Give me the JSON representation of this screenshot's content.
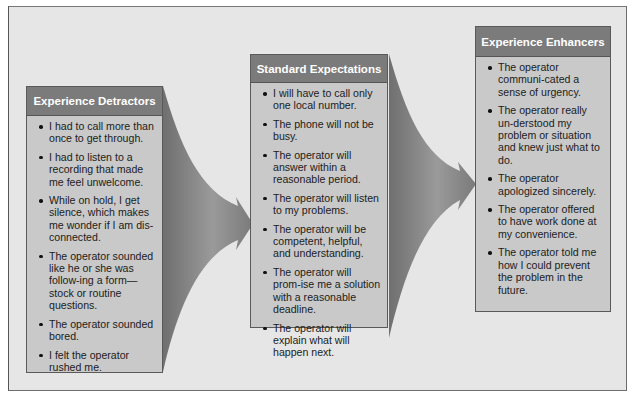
{
  "diagram": {
    "panels": [
      {
        "title": "Experience Detractors",
        "items": [
          "I had to call more than once to get through.",
          "I had to listen to a recording that made me feel unwelcome.",
          "While on hold, I get silence, which makes me wonder if I am dis-connected.",
          "The operator sounded like he or she was follow-ing a form—stock or routine questions.",
          "The operator sounded bored.",
          "I felt the operator rushed me."
        ]
      },
      {
        "title": "Standard Expectations",
        "items": [
          "I will have to call only one local number.",
          "The phone will  not be busy.",
          "The operator will answer within a reasonable period.",
          "The operator will listen to my problems.",
          "The operator will be competent, helpful, and understanding.",
          "The operator will prom-ise me a solution with a reasonable deadline.",
          "The operator will explain what will happen next."
        ]
      },
      {
        "title": "Experience Enhancers",
        "items": [
          "The operator communi-cated a sense of urgency.",
          "The operator really un-derstood my problem or situation and knew just what to do.",
          "The operator apologized sincerely.",
          "The operator offered to have work done at my convenience.",
          "The operator told me how I could prevent the problem in the future."
        ]
      }
    ],
    "arrows": [
      {
        "from": "Experience Detractors",
        "to": "Standard Expectations",
        "icon": "funnel-arrow-icon"
      },
      {
        "from": "Standard Expectations",
        "to": "Experience Enhancers",
        "icon": "funnel-arrow-icon"
      }
    ],
    "colors": {
      "background": "#e6e6e6",
      "panel_fill": "#c9c9c9",
      "header_fill": "#7b7b7b",
      "header_text": "#ffffff",
      "arrow": "#8a8a8a"
    }
  }
}
